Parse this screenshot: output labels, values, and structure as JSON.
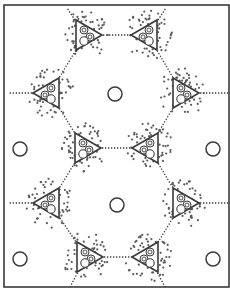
{
  "diagram": {
    "type": "hexagonal-lattice-schematic",
    "frame": {
      "x": 4,
      "y": 5,
      "w": 225,
      "h": 282
    },
    "colors": {
      "ink": "#3a3a3a",
      "dot": "#5a5a5a",
      "background": "#ffffff"
    },
    "triangles": [
      {
        "id": "top-left",
        "cx": 85,
        "cy": 35,
        "dir": "right"
      },
      {
        "id": "top-right",
        "cx": 148,
        "cy": 35,
        "dir": "left"
      },
      {
        "id": "upper-left",
        "cx": 50,
        "cy": 93,
        "dir": "left"
      },
      {
        "id": "upper-right",
        "cx": 182,
        "cy": 93,
        "dir": "right"
      },
      {
        "id": "middle-left",
        "cx": 84,
        "cy": 148,
        "dir": "right"
      },
      {
        "id": "middle-right",
        "cx": 149,
        "cy": 148,
        "dir": "left"
      },
      {
        "id": "lower-left",
        "cx": 50,
        "cy": 203,
        "dir": "left"
      },
      {
        "id": "lower-right",
        "cx": 182,
        "cy": 203,
        "dir": "right"
      },
      {
        "id": "bottom-left",
        "cx": 86,
        "cy": 257,
        "dir": "right"
      },
      {
        "id": "bottom-right",
        "cx": 149,
        "cy": 257,
        "dir": "left"
      }
    ],
    "open_circles": [
      {
        "id": "hex-center-upper",
        "cx": 115,
        "cy": 94,
        "r": 7
      },
      {
        "id": "hex-center-lower",
        "cx": 117,
        "cy": 205,
        "r": 7
      },
      {
        "id": "edge-left-mid",
        "cx": 20,
        "cy": 149,
        "r": 7
      },
      {
        "id": "edge-right-mid",
        "cx": 213,
        "cy": 149,
        "r": 7
      },
      {
        "id": "edge-left-bottom",
        "cx": 20,
        "cy": 259,
        "r": 7
      },
      {
        "id": "edge-right-bottom",
        "cx": 213,
        "cy": 259,
        "r": 7
      }
    ],
    "links": [
      {
        "from": "top-left",
        "to": "top-right"
      },
      {
        "from": "top-left",
        "to": "upper-left"
      },
      {
        "from": "top-right",
        "to": "upper-right"
      },
      {
        "from": "upper-left",
        "to": "middle-left"
      },
      {
        "from": "upper-right",
        "to": "middle-right"
      },
      {
        "from": "middle-left",
        "to": "middle-right"
      },
      {
        "from": "middle-left",
        "to": "lower-left"
      },
      {
        "from": "middle-right",
        "to": "lower-right"
      },
      {
        "from": "lower-left",
        "to": "bottom-left"
      },
      {
        "from": "lower-right",
        "to": "bottom-right"
      },
      {
        "from": "bottom-left",
        "to": "bottom-right"
      }
    ],
    "edge_links": [
      {
        "from": "upper-left",
        "x2": 8,
        "y2": 93
      },
      {
        "from": "upper-right",
        "x2": 228,
        "y2": 93
      },
      {
        "from": "lower-left",
        "x2": 8,
        "y2": 203
      },
      {
        "from": "lower-right",
        "x2": 228,
        "y2": 203
      },
      {
        "from": "top-left",
        "x2": 67,
        "y2": 8
      },
      {
        "from": "top-right",
        "x2": 166,
        "y2": 8
      },
      {
        "from": "bottom-left",
        "x2": 70,
        "y2": 287
      },
      {
        "from": "bottom-right",
        "x2": 165,
        "y2": 287
      }
    ]
  }
}
